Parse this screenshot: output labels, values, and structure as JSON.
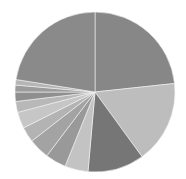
{
  "chart_data": {
    "type": "pie",
    "title": "",
    "start_angle_deg": 0,
    "direction": "clockwise",
    "legend": "none",
    "labels": "none",
    "categories": [
      "Slice 1",
      "Slice 2",
      "Slice 3",
      "Slice 4",
      "Slice 5",
      "Slice 6",
      "Slice 7",
      "Slice 8",
      "Slice 9",
      "Slice 10",
      "Slice 11",
      "Slice 12",
      "Slice 13"
    ],
    "values": [
      23.3,
      16.7,
      11.4,
      4.7,
      4.2,
      4.2,
      3.1,
      3.3,
      2.2,
      1.9,
      1.4,
      1.1,
      22.5
    ],
    "colors": [
      "#878787",
      "#bdbdbd",
      "#767676",
      "#c3c3c3",
      "#999999",
      "#a3a3a3",
      "#b3b3b3",
      "#c6c6c6",
      "#b8b8b8",
      "#8f8f8f",
      "#9c9c9c",
      "#b5b5b5",
      "#8a8a8a"
    ],
    "center": [
      95,
      92
    ],
    "radius": 80
  }
}
